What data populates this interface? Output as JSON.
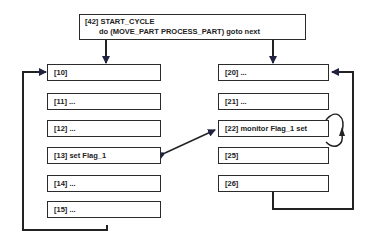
{
  "diagram": {
    "start_block": {
      "label_line1": "[42] START_CYCLE",
      "label_line2": "do (MOVE_PART PROCESS_PART) goto next"
    },
    "left_column": [
      {
        "id": "10",
        "label": "[10]"
      },
      {
        "id": "11",
        "label": "[11] ..."
      },
      {
        "id": "12",
        "label": "[12] ..."
      },
      {
        "id": "13",
        "label": "[13]  set Flag_1"
      },
      {
        "id": "14",
        "label": "[14] ..."
      },
      {
        "id": "15",
        "label": "[15] ..."
      }
    ],
    "right_column": [
      {
        "id": "20",
        "label": "[20] ..."
      },
      {
        "id": "21",
        "label": "[21] ..."
      },
      {
        "id": "22",
        "label": "[22] monitor Flag_1 set"
      },
      {
        "id": "25",
        "label": "[25]"
      },
      {
        "id": "26",
        "label": "[26]"
      }
    ],
    "connections": [
      {
        "from": "42",
        "to": "10",
        "type": "arrow"
      },
      {
        "from": "42",
        "to": "20",
        "type": "arrow"
      },
      {
        "from": "15",
        "to": "10",
        "type": "loop-back"
      },
      {
        "from": "26",
        "to": "20",
        "type": "loop-back"
      },
      {
        "from": "13",
        "to": "22",
        "type": "bidirectional"
      },
      {
        "from": "22",
        "to": "22",
        "type": "self-loop"
      }
    ]
  }
}
